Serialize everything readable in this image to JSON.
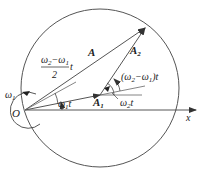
{
  "diagram": {
    "type": "phasor-diagram",
    "labels": {
      "origin": "O",
      "x_axis": "x",
      "resultant": "A",
      "phasor1": "A",
      "phasor1_sub": "1",
      "phasor2": "A",
      "phasor2_sub": "2",
      "omega1": "ω",
      "omega1_sub": "1",
      "angle1": "ω",
      "angle1_sub": "1",
      "angle1_t": "t",
      "angle2": "ω",
      "angle2_sub": "2",
      "angle2_t": "t",
      "rel_angle_open": "(ω",
      "rel_angle_sub2": "2",
      "rel_angle_minus": "−ω",
      "rel_angle_sub1": "1",
      "rel_angle_close": ")t",
      "half_num_a": "ω",
      "half_num_sub2": "2",
      "half_num_minus": "−ω",
      "half_num_sub1": "1",
      "half_den": "2",
      "half_t": "t"
    },
    "colors": {
      "line": "#555555",
      "circle": "#444444",
      "text": "#222222"
    }
  }
}
